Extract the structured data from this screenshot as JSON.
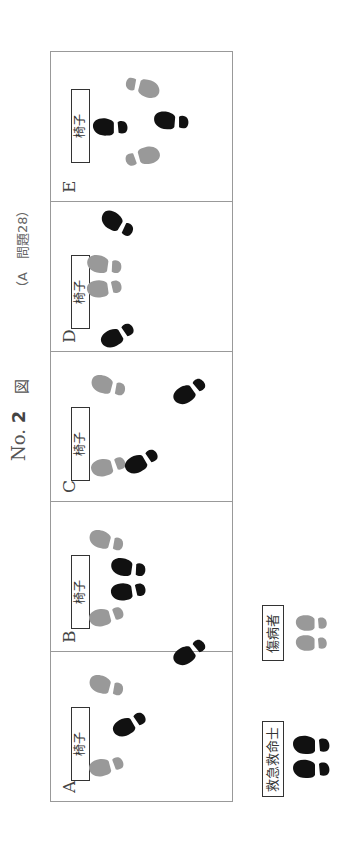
{
  "title": {
    "prefix": "No.",
    "number": "2",
    "figure": "図",
    "reference": "（A　問題28）"
  },
  "chair_label": "椅子",
  "colors": {
    "rescuer": "#111111",
    "patient": "#999999",
    "border": "#999999"
  },
  "panels": [
    {
      "label": "A",
      "chair_x": 20,
      "feet": [
        {
          "role": "patient",
          "x": 35,
          "y": 56,
          "angle": -15
        },
        {
          "role": "patient",
          "x": 115,
          "y": 56,
          "angle": 15
        },
        {
          "role": "rescuer",
          "x": 77,
          "y": 79,
          "angle": -30
        },
        {
          "role": "rescuer",
          "x": 149,
          "y": 139,
          "angle": -35
        }
      ]
    },
    {
      "label": "B",
      "chair_x": 22,
      "feet": [
        {
          "role": "patient",
          "x": 35,
          "y": 56,
          "angle": -15
        },
        {
          "role": "patient",
          "x": 110,
          "y": 56,
          "angle": 15
        },
        {
          "role": "rescuer",
          "x": 60,
          "y": 78,
          "angle": -8
        },
        {
          "role": "rescuer",
          "x": 83,
          "y": 78,
          "angle": 8
        }
      ]
    },
    {
      "label": "C",
      "chair_x": 20,
      "feet": [
        {
          "role": "patient",
          "x": 35,
          "y": 58,
          "angle": -15
        },
        {
          "role": "patient",
          "x": 115,
          "y": 58,
          "angle": 15
        },
        {
          "role": "rescuer",
          "x": 40,
          "y": 91,
          "angle": -30
        },
        {
          "role": "rescuer",
          "x": 110,
          "y": 139,
          "angle": -35
        }
      ]
    },
    {
      "label": "D",
      "chair_x": 22,
      "feet": [
        {
          "role": "patient",
          "x": 63,
          "y": 54,
          "angle": -8
        },
        {
          "role": "patient",
          "x": 86,
          "y": 54,
          "angle": 8
        },
        {
          "role": "rescuer",
          "x": 16,
          "y": 67,
          "angle": -30
        },
        {
          "role": "rescuer",
          "x": 127,
          "y": 67,
          "angle": 30
        }
      ]
    },
    {
      "label": "E",
      "chair_x": 38,
      "feet": [
        {
          "role": "patient",
          "x": 44,
          "y": 91,
          "angle": 165
        },
        {
          "role": "patient",
          "x": 114,
          "y": 91,
          "angle": 195
        },
        {
          "role": "rescuer",
          "x": 74,
          "y": 60,
          "angle": 0
        },
        {
          "role": "rescuer",
          "x": 80,
          "y": 121,
          "angle": 5
        }
      ]
    }
  ],
  "legend": [
    {
      "label": "救急救命士",
      "role": "rescuer"
    },
    {
      "label": "傷病者",
      "role": "patient"
    }
  ]
}
